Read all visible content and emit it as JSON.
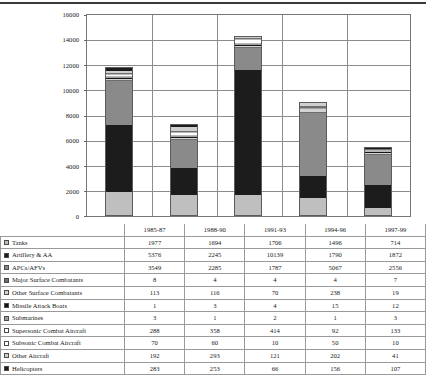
{
  "chart_data": {
    "type": "bar",
    "subtype": "stacked-column",
    "title": "",
    "xlabel": "",
    "ylabel": "",
    "ylim": [
      0,
      16000
    ],
    "ytick_values": [
      16000,
      14000,
      12000,
      10000,
      8000,
      6000,
      4000,
      2000,
      0
    ],
    "ytick_labels": [
      "16000",
      "14000",
      "12000",
      "10000",
      "8000",
      "6000",
      "4000",
      "2000",
      "0"
    ],
    "grid": true,
    "legend_position": "table-row-labels",
    "categories": [
      "1985-87",
      "1988-90",
      "1991-93",
      "1994-96",
      "1997-99"
    ],
    "series": [
      {
        "name": "Tanks",
        "values": [
          1977,
          1694,
          1706,
          1496,
          714
        ],
        "color": "#bfbfbf",
        "swatch": "#bfbfbf"
      },
      {
        "name": "Artillery & AA",
        "values": [
          5376,
          2245,
          10139,
          1790,
          1872
        ],
        "color": "#1c1c1c",
        "swatch": "#1c1c1c"
      },
      {
        "name": "APCs/AFVs",
        "values": [
          3549,
          2285,
          1787,
          5067,
          2556
        ],
        "color": "#8a8a8a",
        "swatch": "#8a8a8a"
      },
      {
        "name": "Major Surface Combatants",
        "values": [
          8,
          4,
          4,
          4,
          7
        ],
        "color": "#6e6e6e",
        "swatch": "#6e6e6e"
      },
      {
        "name": "Other Surface Combatants",
        "values": [
          113,
          116,
          70,
          238,
          19
        ],
        "color": "#d4d4d4",
        "swatch": "#d4d4d4"
      },
      {
        "name": "Missile Attack Boats",
        "values": [
          1,
          3,
          4,
          15,
          12
        ],
        "color": "#141414",
        "swatch": "#141414"
      },
      {
        "name": "Submarines",
        "values": [
          3,
          1,
          2,
          1,
          3
        ],
        "color": "#9e9e9e",
        "swatch": "#9e9e9e"
      },
      {
        "name": "Supersonic Combat Aircraft",
        "values": [
          288,
          358,
          414,
          92,
          133
        ],
        "color": "#ffffff",
        "swatch": "#ffffff"
      },
      {
        "name": "Subsonic Combat Aircraft",
        "values": [
          70,
          60,
          10,
          50,
          10
        ],
        "color": "#fbfbfb",
        "swatch": "#ffffff"
      },
      {
        "name": "Other Aircraft",
        "values": [
          192,
          293,
          121,
          202,
          41
        ],
        "color": "#cfcfcf",
        "swatch": "#cfcfcf"
      },
      {
        "name": "Helicopters",
        "values": [
          283,
          253,
          66,
          156,
          107
        ],
        "color": "#1c1c1c",
        "swatch": "#1c1c1c"
      }
    ]
  }
}
